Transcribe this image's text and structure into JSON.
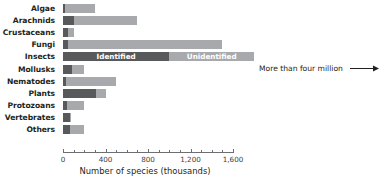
{
  "chart_data": {
    "type": "bar",
    "orientation": "horizontal",
    "stacked": true,
    "title": "",
    "xlabel": "Number of species (thousands)",
    "ylabel": "",
    "xlim": [
      0,
      1700
    ],
    "xticks": [
      0,
      400,
      800,
      1200,
      1600
    ],
    "xticklabels": [
      "0",
      "400",
      "800",
      "1,200",
      "1,600"
    ],
    "minor_tick_interval": 100,
    "grid": false,
    "legend": {
      "position": "inside-insects-bar",
      "entries": [
        {
          "name": "Identified",
          "color": "#58595b"
        },
        {
          "name": "Unidentified",
          "color": "#a7a9ac"
        }
      ]
    },
    "categories": [
      "Algae",
      "Arachnids",
      "Crustaceans",
      "Fungi",
      "Insects",
      "Mollusks",
      "Nematodes",
      "Plants",
      "Protozoans",
      "Vertebrates",
      "Others"
    ],
    "series": [
      {
        "name": "Identified",
        "color": "#58595b",
        "values": [
          15,
          102,
          47,
          43,
          1000,
          85,
          25,
          310,
          40,
          64,
          70
        ]
      },
      {
        "name": "Unidentified",
        "color": "#a7a9ac",
        "values": [
          285,
          598,
          53,
          1457,
          800,
          115,
          475,
          90,
          160,
          16,
          130
        ]
      }
    ],
    "totals": [
      300,
      700,
      100,
      1500,
      1800,
      200,
      500,
      400,
      200,
      80,
      200
    ],
    "annotations": [
      {
        "text": "More than four million",
        "arrow": "right"
      }
    ]
  },
  "chart": {
    "axis": {
      "title": "Number of species (thousands)",
      "ticks": [
        {
          "label": "0",
          "value": 0
        },
        {
          "label": "400",
          "value": 400
        },
        {
          "label": "800",
          "value": 800
        },
        {
          "label": "1,200",
          "value": 1200
        },
        {
          "label": "1,600",
          "value": 1600
        }
      ]
    },
    "legend_identified": "Identified",
    "legend_unidentified": "Unidentified",
    "annotation_more": "More than four million",
    "rows": [
      {
        "label": "Algae",
        "identified": 15,
        "unidentified": 285
      },
      {
        "label": "Arachnids",
        "identified": 102,
        "unidentified": 598
      },
      {
        "label": "Crustaceans",
        "identified": 47,
        "unidentified": 53
      },
      {
        "label": "Fungi",
        "identified": 43,
        "unidentified": 1457
      },
      {
        "label": "Insects",
        "identified": 1000,
        "unidentified": 800
      },
      {
        "label": "Mollusks",
        "identified": 85,
        "unidentified": 115
      },
      {
        "label": "Nematodes",
        "identified": 25,
        "unidentified": 475
      },
      {
        "label": "Plants",
        "identified": 310,
        "unidentified": 90
      },
      {
        "label": "Protozoans",
        "identified": 40,
        "unidentified": 160
      },
      {
        "label": "Vertebrates",
        "identified": 64,
        "unidentified": 16
      },
      {
        "label": "Others",
        "identified": 70,
        "unidentified": 130
      }
    ]
  },
  "colors": {
    "identified": "#58595b",
    "unidentified": "#a7a9ac",
    "text": "#231f20",
    "axis": "#6d6e71",
    "background": "#ffffff"
  }
}
